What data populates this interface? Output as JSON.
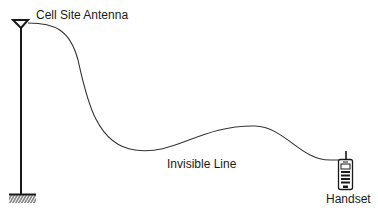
{
  "diagram": {
    "labels": {
      "antenna": "Cell Site Antenna",
      "line": "Invisible Line",
      "handset": "Handset"
    },
    "nodes": [
      {
        "id": "antenna",
        "label": "Cell Site Antenna",
        "icon": "antenna-tower-icon"
      },
      {
        "id": "handset",
        "label": "Handset",
        "icon": "mobile-phone-icon"
      }
    ],
    "edges": [
      {
        "from": "antenna",
        "to": "handset",
        "label": "Invisible Line",
        "style": "curved"
      }
    ],
    "colors": {
      "stroke": "#1a1a1a",
      "background": "#ffffff"
    }
  }
}
